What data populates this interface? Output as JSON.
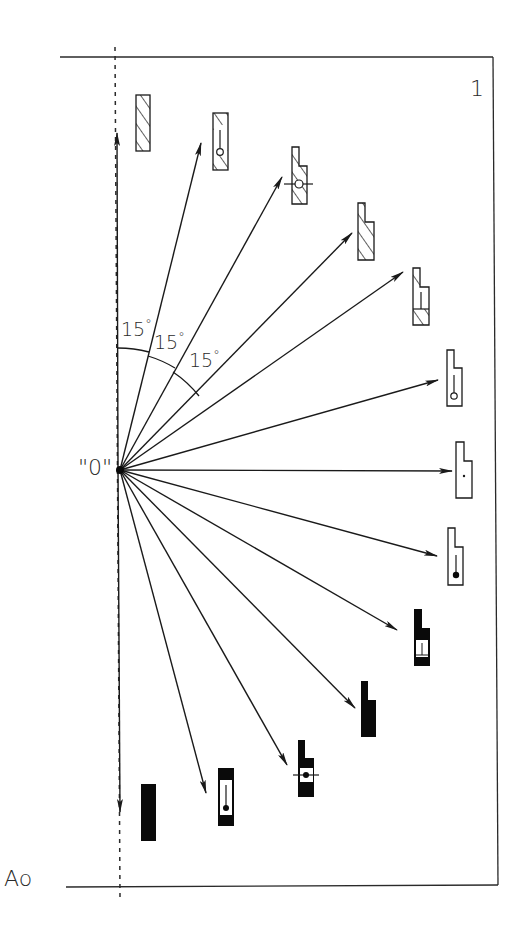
{
  "diagram": {
    "frame_number": "1",
    "origin_label": "\"0\"",
    "reference_label": "Ao",
    "angle_step_deg": 15,
    "angle_labels": [
      {
        "value": "15",
        "unit": "°"
      },
      {
        "value": "15",
        "unit": "°"
      },
      {
        "value": "15",
        "unit": "°"
      }
    ],
    "arrow_angles_deg": [
      0,
      15,
      30,
      45,
      60,
      75,
      90,
      105,
      120,
      135,
      150,
      165,
      180
    ],
    "symbols": [
      {
        "index": 0,
        "angle": 0,
        "shape": "rectangle",
        "fill": "hatched",
        "marker": "none"
      },
      {
        "index": 1,
        "angle": 15,
        "shape": "rectangle",
        "fill": "hatched",
        "marker": "stem-open-circle"
      },
      {
        "index": 2,
        "angle": 30,
        "shape": "stepped",
        "fill": "hatched",
        "marker": "crosshair-open-circle"
      },
      {
        "index": 3,
        "angle": 45,
        "shape": "stepped",
        "fill": "hatched",
        "marker": "none"
      },
      {
        "index": 4,
        "angle": 60,
        "shape": "stepped",
        "fill": "hatched",
        "marker": "t-window"
      },
      {
        "index": 5,
        "angle": 75,
        "shape": "stepped",
        "fill": "outline",
        "marker": "stem-open-circle"
      },
      {
        "index": 6,
        "angle": 90,
        "shape": "stepped",
        "fill": "outline",
        "marker": "dot"
      },
      {
        "index": 7,
        "angle": 105,
        "shape": "stepped",
        "fill": "outline",
        "marker": "stem-filled-dot"
      },
      {
        "index": 8,
        "angle": 120,
        "shape": "stepped",
        "fill": "black",
        "marker": "t-window"
      },
      {
        "index": 9,
        "angle": 135,
        "shape": "stepped",
        "fill": "black",
        "marker": "none"
      },
      {
        "index": 10,
        "angle": 150,
        "shape": "stepped",
        "fill": "black",
        "marker": "crosshair-filled-dot"
      },
      {
        "index": 11,
        "angle": 165,
        "shape": "rectangle",
        "fill": "black",
        "marker": "stem-filled-dot"
      },
      {
        "index": 12,
        "angle": 180,
        "shape": "rectangle",
        "fill": "black",
        "marker": "none"
      }
    ],
    "colors": {
      "line": "#1a1a1a",
      "fill_black": "#0a0a0a",
      "background": "#ffffff"
    }
  }
}
